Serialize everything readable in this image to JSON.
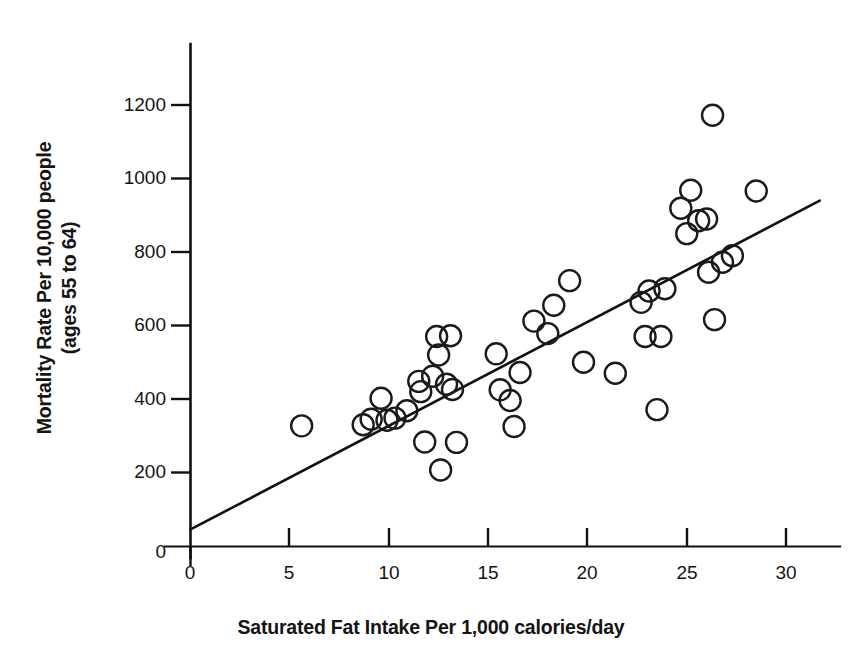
{
  "chart_data": {
    "type": "scatter",
    "title": "",
    "xlabel": "Saturated Fat Intake Per 1,000 calories/day",
    "ylabel_lines": [
      "Mortality Rate Per 10,000 people",
      "(ages 55 to 64)"
    ],
    "ylabel": "Mortality Rate Per 10,000 people (ages 55 to 64)",
    "xlim": [
      0,
      31.5
    ],
    "ylim": [
      0,
      1290
    ],
    "xticks": [
      0,
      5,
      10,
      15,
      20,
      25,
      30
    ],
    "xtick_labels": [
      "0",
      "5",
      "10",
      "15",
      "20",
      "25",
      "30"
    ],
    "yticks": [
      0,
      200,
      400,
      600,
      800,
      1000,
      1200
    ],
    "ytick_labels": [
      "0",
      "200",
      "400",
      "600",
      "800",
      "1000",
      "1200"
    ],
    "grid": false,
    "legend": null,
    "marker": "open-circle",
    "marker_color": "#1a1a1a",
    "marker_fill": "none",
    "points": [
      {
        "x": 5.6,
        "y": 327
      },
      {
        "x": 8.7,
        "y": 330
      },
      {
        "x": 9.1,
        "y": 345
      },
      {
        "x": 9.6,
        "y": 402
      },
      {
        "x": 9.9,
        "y": 342
      },
      {
        "x": 10.3,
        "y": 348
      },
      {
        "x": 10.9,
        "y": 368
      },
      {
        "x": 11.5,
        "y": 448
      },
      {
        "x": 11.6,
        "y": 420
      },
      {
        "x": 11.8,
        "y": 283
      },
      {
        "x": 12.2,
        "y": 462
      },
      {
        "x": 12.4,
        "y": 570
      },
      {
        "x": 12.5,
        "y": 520
      },
      {
        "x": 12.6,
        "y": 207
      },
      {
        "x": 12.9,
        "y": 440
      },
      {
        "x": 13.1,
        "y": 572
      },
      {
        "x": 13.2,
        "y": 426
      },
      {
        "x": 13.4,
        "y": 282
      },
      {
        "x": 15.4,
        "y": 523
      },
      {
        "x": 15.6,
        "y": 425
      },
      {
        "x": 16.1,
        "y": 396
      },
      {
        "x": 16.3,
        "y": 325
      },
      {
        "x": 16.6,
        "y": 472
      },
      {
        "x": 17.3,
        "y": 612
      },
      {
        "x": 18.0,
        "y": 578
      },
      {
        "x": 18.3,
        "y": 655
      },
      {
        "x": 19.1,
        "y": 722
      },
      {
        "x": 19.8,
        "y": 500
      },
      {
        "x": 21.4,
        "y": 470
      },
      {
        "x": 22.7,
        "y": 663
      },
      {
        "x": 22.9,
        "y": 570
      },
      {
        "x": 23.1,
        "y": 694
      },
      {
        "x": 23.5,
        "y": 371
      },
      {
        "x": 23.7,
        "y": 570
      },
      {
        "x": 23.9,
        "y": 700
      },
      {
        "x": 24.7,
        "y": 919
      },
      {
        "x": 25.0,
        "y": 850
      },
      {
        "x": 25.2,
        "y": 968
      },
      {
        "x": 25.6,
        "y": 885
      },
      {
        "x": 26.0,
        "y": 890
      },
      {
        "x": 26.1,
        "y": 745
      },
      {
        "x": 26.3,
        "y": 1172
      },
      {
        "x": 26.4,
        "y": 616
      },
      {
        "x": 26.8,
        "y": 772
      },
      {
        "x": 27.3,
        "y": 790
      },
      {
        "x": 28.5,
        "y": 966
      }
    ],
    "trendline": {
      "label": "least-squares fit",
      "x_start": 0.0,
      "y_start": 45,
      "x_end": 31.7,
      "y_end": 940
    }
  }
}
